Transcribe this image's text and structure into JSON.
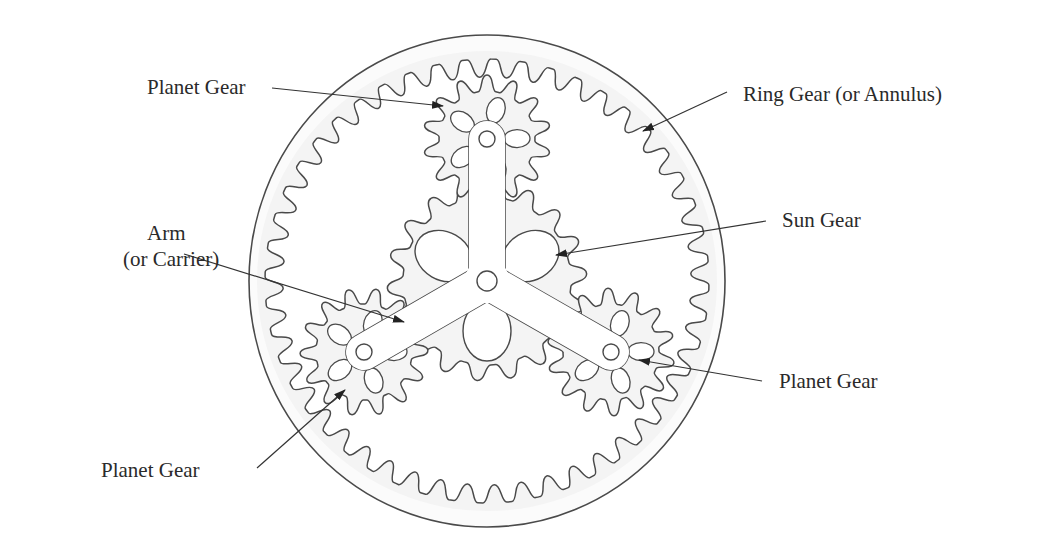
{
  "diagram": {
    "stroke_color": "#4a4a4a",
    "fill_color": "#f4f4f4",
    "center": [
      487,
      281
    ],
    "ring_gear": {
      "outer_circle": {
        "rx": 238,
        "ry": 246
      },
      "teeth": 48,
      "tip_radius": 204,
      "root_radius": 222
    },
    "sun_gear": {
      "center": [
        487,
        281
      ],
      "teeth": 18,
      "tip_radius": 100,
      "root_radius": 84
    },
    "planet_gears": [
      {
        "name": "top",
        "center": [
          487,
          139
        ],
        "teeth": 14,
        "tip_radius": 64,
        "root_radius": 48
      },
      {
        "name": "left",
        "center": [
          364,
          352
        ],
        "teeth": 14,
        "tip_radius": 64,
        "root_radius": 48
      },
      {
        "name": "right",
        "center": [
          611,
          352
        ],
        "teeth": 14,
        "tip_radius": 64,
        "root_radius": 48
      }
    ],
    "arm": {
      "width": 36,
      "hub_hole_radius": 10,
      "end_hole_radius": 8
    }
  },
  "labels": {
    "planet_gear_top": "Planet Gear",
    "ring_gear": "Ring Gear (or Annulus)",
    "arm_line1": "Arm",
    "arm_line2": "(or Carrier)",
    "sun_gear": "Sun Gear",
    "planet_gear_right": "Planet Gear",
    "planet_gear_bottom": "Planet Gear"
  },
  "leaders": [
    {
      "name": "planet-top-leader",
      "from": [
        272,
        88
      ],
      "to": [
        443,
        106
      ]
    },
    {
      "name": "ring-gear-leader",
      "from": [
        727,
        92
      ],
      "to": [
        643,
        131
      ]
    },
    {
      "name": "arm-leader",
      "from": [
        184,
        254
      ],
      "to": [
        404,
        322
      ]
    },
    {
      "name": "sun-gear-leader",
      "from": [
        766,
        221
      ],
      "to": [
        556,
        255
      ]
    },
    {
      "name": "planet-right-leader",
      "from": [
        762,
        381
      ],
      "to": [
        639,
        360
      ]
    },
    {
      "name": "planet-bottom-leader",
      "from": [
        257,
        468
      ],
      "to": [
        345,
        390
      ]
    }
  ]
}
